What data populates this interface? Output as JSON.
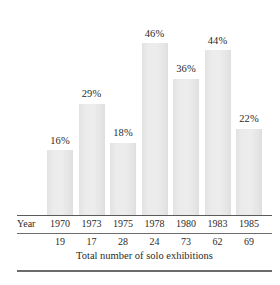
{
  "chart_data": {
    "type": "bar",
    "title": "",
    "xlabel": "",
    "ylabel": "",
    "caption": "Total number of solo exhibitions",
    "row_header_label": "Year",
    "grid": false,
    "legend": "none",
    "ylim": [
      0,
      50
    ],
    "categories": [
      "1970",
      "1973",
      "1975",
      "1978",
      "1980",
      "1983",
      "1985"
    ],
    "values": [
      16,
      29,
      18,
      46,
      36,
      44,
      22
    ],
    "value_labels": [
      "16%",
      "29%",
      "18%",
      "46%",
      "36%",
      "44%",
      "22%"
    ],
    "series": [
      {
        "name": "percent",
        "values": [
          16,
          29,
          18,
          46,
          36,
          44,
          22
        ]
      },
      {
        "name": "Total number of solo exhibitions",
        "values": [
          19,
          17,
          28,
          24,
          73,
          62,
          69
        ]
      }
    ],
    "counts": [
      19,
      17,
      28,
      24,
      73,
      62,
      69
    ],
    "count_labels": [
      "19",
      "17",
      "28",
      "24",
      "73",
      "62",
      "69"
    ],
    "colors": {
      "bar_fill": "#e9e9e9",
      "rule": "#5a5a5a",
      "text": "#2b2b2b",
      "background": "#ffffff"
    }
  }
}
